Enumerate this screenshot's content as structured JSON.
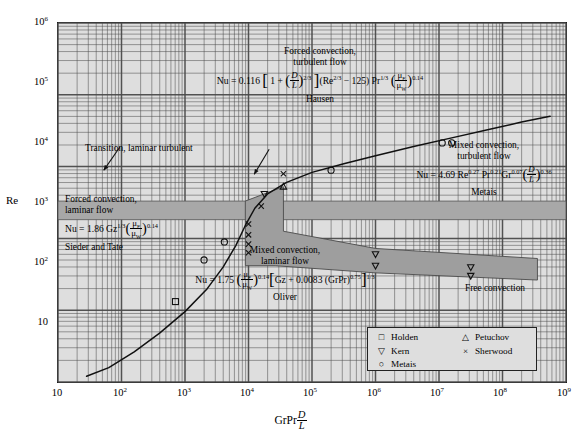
{
  "axes": {
    "y_label": "Re",
    "y_ticks": [
      "10",
      "10<sup>2</sup>",
      "10<sup>3</sup>",
      "10<sup>4</sup>",
      "10<sup>5</sup>",
      "10<sup>6</sup>"
    ],
    "x_ticks": [
      "10",
      "10<sup>2</sup>",
      "10<sup>3</sup>",
      "10<sup>4</sup>",
      "10<sup>5</sup>",
      "10<sup>6</sup>",
      "10<sup>7</sup>",
      "10<sup>8</sup>",
      "10<sup>9</sup>"
    ],
    "x_label_html": "GrPr<span class=\"frac\"><span class=\"num it\">D</span><span class=\"den it\">L</span></span>"
  },
  "regions": {
    "forced_turbulent": {
      "title_line1": "Forced convection,",
      "title_line2": "turbulent flow",
      "author": "Hausen",
      "equation_html": "Nu = 0.116 <span class=\"bigbr\">[</span> 1 + <span class=\"paren\">(</span><span class=\"frac\"><span class=\"num it\">D</span><span class=\"den it\">L</span></span><span class=\"paren\">)</span><sup>2/3</sup> <span class=\"bigbr\">]</span>(Re<sup>2/3</sup> &#8722; 125) Pr<sup>1/3</sup> <span class=\"paren\">(</span><span class=\"frac\"><span class=\"num\">&#956;<sub>F</sub></span><span class=\"den\">&#956;<sub>W</sub></span></span><span class=\"paren\">)</span><sup>0.14</sup>"
    },
    "mixed_turbulent": {
      "title_line1": "Mixed convection,",
      "title_line2": "turbulent flow",
      "author": "Metais",
      "equation_html": "Nu = 4.69 Re<sup>0.27</sup> Pr<sup>0.21</sup>Gr<sup>0.07</sup><span class=\"paren\">(</span><span class=\"frac\"><span class=\"num it\">D</span><span class=\"den it\">L</span></span><span class=\"paren\">)</span><sup>0.36</sup>"
    },
    "forced_laminar": {
      "title_line1": "Forced convection,",
      "title_line2": "laminar flow",
      "author": "Sieder and Tate",
      "equation_html": "Nu = 1.86 Gz<sup>1/3</sup><span class=\"paren\">(</span><span class=\"frac\"><span class=\"num\">&#956;<sub>F</sub></span><span class=\"den\">&#956;<sub>W</sub></span></span><span class=\"paren\">)</span><sup>0.14</sup>"
    },
    "mixed_laminar": {
      "title_line1": "Mixed convection,",
      "title_line2": "laminar flow",
      "author": "Oliver",
      "equation_html": "Nu = 1.75 <span class=\"paren\">(</span><span class=\"frac\"><span class=\"num\">&#956;<sub>F</sub></span><span class=\"den\">&#956;<sub>W</sub></span></span><span class=\"paren\">)</span><sup>0.14</sup><span class=\"bigbr\">[</span>Gz + 0.0083 (GrPr)<sup>0.75</sup><span class=\"bigbr\">]</span><sup>1/3</sup>"
    },
    "free_convection": {
      "title": "Free convection"
    },
    "transition": {
      "label": "Transition, laminar turbulent"
    }
  },
  "legend": {
    "entries": [
      {
        "glyph": "□",
        "label": "Holden"
      },
      {
        "glyph": "▽",
        "label": "Kern"
      },
      {
        "glyph": "○",
        "label": "Metais"
      },
      {
        "glyph": "△",
        "label": "Petuchov"
      },
      {
        "glyph": "×",
        "label": "Sherwood"
      }
    ]
  },
  "colors": {
    "plot_background": "#dedede",
    "grid_line": "#4a4a4a",
    "band_fill": "#a8a8a8",
    "curve": "#111111",
    "frame": "#1a1a1a"
  },
  "chart_data": {
    "type": "line",
    "xlabel": "GrPr D/L",
    "ylabel": "Re",
    "xlim": [
      1,
      9
    ],
    "ylim": [
      1,
      6
    ],
    "log_x": true,
    "log_y": true,
    "grid": true,
    "legend_position": "bottom-right",
    "series": [
      {
        "name": "forced-mixed convection boundary",
        "type": "line",
        "points_log": [
          [
            1.45,
            1.08
          ],
          [
            1.8,
            1.2
          ],
          [
            2.2,
            1.42
          ],
          [
            2.6,
            1.68
          ],
          [
            3.0,
            1.98
          ],
          [
            3.35,
            2.3
          ],
          [
            3.6,
            2.6
          ],
          [
            3.8,
            2.9
          ],
          [
            3.95,
            3.18
          ],
          [
            4.1,
            3.42
          ],
          [
            4.3,
            3.62
          ],
          [
            4.6,
            3.78
          ],
          [
            5.0,
            3.92
          ],
          [
            5.5,
            4.04
          ],
          [
            6.0,
            4.15
          ],
          [
            6.6,
            4.28
          ],
          [
            7.2,
            4.4
          ],
          [
            7.8,
            4.52
          ],
          [
            8.3,
            4.62
          ],
          [
            8.75,
            4.7
          ]
        ]
      }
    ],
    "bands": [
      {
        "name": "transition-laminar-turbulent",
        "y_log_range": [
          3.26,
          3.52
        ],
        "x_log_range": [
          1,
          9
        ]
      }
    ],
    "markers": [
      {
        "name": "Holden",
        "glyph": "square",
        "points_log": [
          [
            2.85,
            2.12
          ]
        ]
      },
      {
        "name": "Metais",
        "glyph": "circle",
        "points_log": [
          [
            3.62,
            2.95
          ],
          [
            5.3,
            3.95
          ],
          [
            7.05,
            4.33
          ],
          [
            7.2,
            4.33
          ],
          [
            3.3,
            2.7
          ]
        ]
      },
      {
        "name": "Sherwood",
        "glyph": "cross",
        "points_log": [
          [
            4.0,
            3.2
          ],
          [
            4.0,
            3.05
          ],
          [
            4.0,
            2.92
          ],
          [
            4.0,
            2.8
          ],
          [
            4.55,
            3.9
          ],
          [
            4.2,
            3.45
          ]
        ]
      },
      {
        "name": "Petuchov",
        "glyph": "triangle-up",
        "points_log": [
          [
            4.55,
            3.72
          ]
        ]
      },
      {
        "name": "Kern",
        "glyph": "triangle-down",
        "points_log": [
          [
            4.25,
            3.62
          ],
          [
            6.0,
            2.78
          ],
          [
            6.0,
            2.62
          ],
          [
            7.5,
            2.6
          ],
          [
            7.5,
            2.48
          ]
        ]
      }
    ]
  }
}
